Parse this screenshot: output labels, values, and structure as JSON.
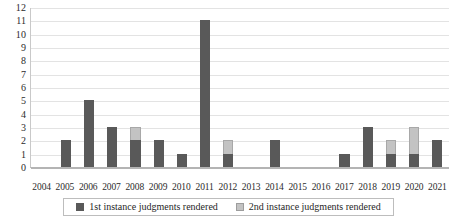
{
  "chart_data": {
    "type": "bar",
    "stacked": true,
    "title": "",
    "subtitle": "",
    "xlabel": "",
    "ylabel": "",
    "ylim": [
      0,
      12
    ],
    "ytick_step": 1,
    "yticks": [
      "12",
      "11",
      "10",
      "9",
      "8",
      "7",
      "6",
      "5",
      "4",
      "3",
      "2",
      "1",
      "0"
    ],
    "grid": "horizontal",
    "legend_position": "bottom",
    "categories": [
      "2004",
      "2005",
      "2006",
      "2007",
      "2008",
      "2009",
      "2010",
      "2011",
      "2012",
      "2013",
      "2014",
      "2015",
      "2016",
      "2017",
      "2018",
      "2019",
      "2020",
      "2021"
    ],
    "series": [
      {
        "name": "1st instance judgments rendered",
        "color": "#595959",
        "values": [
          0,
          2,
          5,
          3,
          2,
          2,
          1,
          11,
          1,
          0,
          2,
          0,
          0,
          1,
          3,
          1,
          1,
          2
        ]
      },
      {
        "name": "2nd instance judgments rendered",
        "color": "#c3c3c3",
        "values": [
          0,
          0,
          0,
          0,
          1,
          0,
          0,
          0,
          1,
          0,
          0,
          0,
          0,
          0,
          0,
          1,
          2,
          0
        ]
      }
    ],
    "totals": [
      0,
      2,
      5,
      3,
      3,
      2,
      1,
      11,
      2,
      0,
      2,
      0,
      0,
      1,
      3,
      2,
      3,
      2
    ]
  },
  "legend": {
    "items": [
      {
        "label": "1st instance judgments rendered",
        "color": "#595959"
      },
      {
        "label": "2nd instance judgments rendered",
        "color": "#c3c3c3"
      }
    ]
  }
}
